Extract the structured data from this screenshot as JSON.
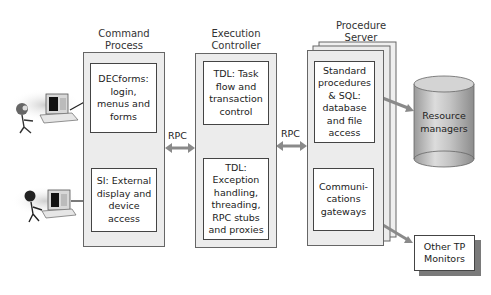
{
  "columns": {
    "command_process": {
      "title": [
        "Command",
        "Process"
      ],
      "modules": [
        {
          "lines": [
            "DECforms:",
            "login,",
            "menus and",
            "forms"
          ]
        },
        {
          "lines": [
            "SI: External",
            "display and",
            "device",
            "access"
          ]
        }
      ]
    },
    "execution_controller": {
      "title": [
        "Execution",
        "Controller"
      ],
      "modules": [
        {
          "lines": [
            "TDL: Task",
            "flow and",
            "transaction",
            "control"
          ]
        },
        {
          "lines": [
            "TDL:",
            "Exception",
            "handling,",
            "threading,",
            "RPC stubs",
            "and proxies"
          ]
        }
      ]
    },
    "procedure_server": {
      "title": [
        "Procedure",
        "Server"
      ],
      "modules": [
        {
          "lines": [
            "Standard",
            "procedures",
            "& SQL:",
            "database",
            "and file",
            "access"
          ]
        },
        {
          "lines": [
            "Communi-",
            "cations",
            "gateways"
          ]
        }
      ]
    }
  },
  "connectors": {
    "rpc_left": "RPC",
    "rpc_right": "RPC"
  },
  "external": {
    "resource_managers": [
      "Resource",
      "managers"
    ],
    "other_tp_monitors": [
      "Other TP",
      "Monitors"
    ]
  },
  "colors": {
    "panel": "#ececec",
    "border": "#555555",
    "arrow": "#8a8a8a",
    "cylinder": "#c8c8c8"
  }
}
